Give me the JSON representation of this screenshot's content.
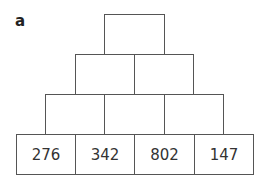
{
  "label": "a",
  "pyramid": {
    "rows": [
      {
        "cells": [
          ""
        ]
      },
      {
        "cells": [
          "",
          ""
        ]
      },
      {
        "cells": [
          "",
          "",
          ""
        ]
      },
      {
        "cells": [
          "276",
          "342",
          "802",
          "147"
        ]
      }
    ]
  }
}
